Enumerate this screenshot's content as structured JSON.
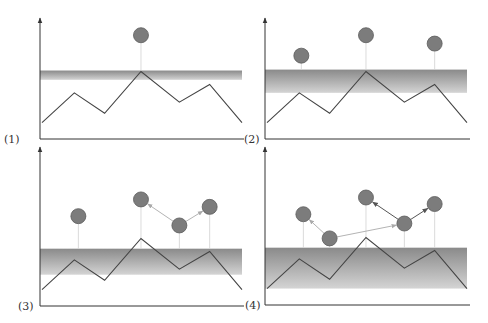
{
  "figure": {
    "colors": {
      "axis": "#333333",
      "curve": "#444444",
      "particle_fill": "#7c7c7c",
      "particle_stroke": "#5c5c5c",
      "drop_line": "#d0d0d0",
      "arrow_light": "#aaaaaa",
      "arrow_dark": "#555555",
      "band_top": "#8a8a8a",
      "band_bottom": "#d4d4d4"
    },
    "landscape": {
      "x": [
        0,
        0.16,
        0.31,
        0.49,
        0.68,
        0.83,
        0.99
      ],
      "y": [
        0.08,
        0.4,
        0.18,
        0.63,
        0.3,
        0.49,
        0.08
      ]
    },
    "panels": [
      {
        "label": "(1)",
        "band": [
          0.54,
          0.64
        ],
        "particles": [
          {
            "x": 0.49,
            "y": 1.02
          }
        ],
        "arrows": []
      },
      {
        "label": "(2)",
        "band": [
          0.4,
          0.65
        ],
        "particles": [
          {
            "x": 0.17,
            "y": 0.8
          },
          {
            "x": 0.49,
            "y": 1.02
          },
          {
            "x": 0.83,
            "y": 0.93
          }
        ],
        "arrows": []
      },
      {
        "label": "(3)",
        "band": [
          0.24,
          0.52
        ],
        "particles": [
          {
            "x": 0.18,
            "y": 0.87
          },
          {
            "x": 0.49,
            "y": 1.05
          },
          {
            "x": 0.68,
            "y": 0.77
          },
          {
            "x": 0.83,
            "y": 0.97
          }
        ],
        "arrows": [
          {
            "from": 2,
            "to": 1,
            "tone": "light"
          },
          {
            "from": 2,
            "to": 3,
            "tone": "light"
          }
        ]
      },
      {
        "label": "(4)",
        "band": [
          0.08,
          0.52
        ],
        "particles": [
          {
            "x": 0.18,
            "y": 0.88
          },
          {
            "x": 0.31,
            "y": 0.62
          },
          {
            "x": 0.49,
            "y": 1.06
          },
          {
            "x": 0.68,
            "y": 0.78
          },
          {
            "x": 0.83,
            "y": 0.99
          }
        ],
        "arrows": [
          {
            "from": 1,
            "to": 0,
            "tone": "light"
          },
          {
            "from": 1,
            "to": 3,
            "tone": "light"
          },
          {
            "from": 3,
            "to": 2,
            "tone": "dark"
          },
          {
            "from": 3,
            "to": 4,
            "tone": "dark"
          }
        ]
      }
    ]
  }
}
